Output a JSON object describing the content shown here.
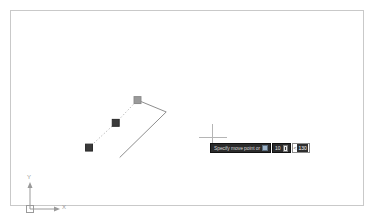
{
  "app": {
    "name": "CAD Model Space",
    "background_color": "#ffffff",
    "frame_border_color": "#c9c9c9"
  },
  "dynamic_input": {
    "prompt_text": "Specify move point or",
    "prompt_icon": "dropdown-arrow-icon",
    "distance_value": "10",
    "distance_lock_icon": "lock-icon",
    "angle_symbol": "<",
    "angle_value": "130",
    "prompt_bg_color": "#2b2b2b",
    "prompt_text_color": "#d8d8d8",
    "angle_highlight_color": "#2f2f2f"
  },
  "cursor": {
    "type": "crosshair",
    "color": "#b5b5b5",
    "x": 202,
    "y": 127
  },
  "ucs_icon": {
    "y_axis_label": "Y",
    "x_axis_label": "X",
    "origin_marker": "square-origin-marker",
    "color": "#9a9a9a"
  },
  "geometry": {
    "grips": [
      {
        "name": "grip-base-point",
        "x": 88,
        "y": 148,
        "state": "selected",
        "color": "#3a3a3a"
      },
      {
        "name": "grip-midpoint",
        "x": 115,
        "y": 123,
        "state": "selected",
        "color": "#3a3a3a"
      },
      {
        "name": "grip-hot",
        "x": 137,
        "y": 100,
        "state": "hot",
        "color": "#9a9a9a"
      }
    ],
    "dashed_polyline": {
      "name": "move-preview-line",
      "points": "88,148 115,123 137,100",
      "style": "dotted",
      "color": "#b0b0b0"
    },
    "solid_polyline": {
      "name": "source-geometry",
      "points": "137,100 166,112 119,158",
      "style": "solid",
      "color": "#8c8c8c"
    }
  }
}
